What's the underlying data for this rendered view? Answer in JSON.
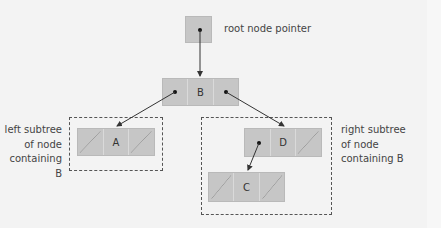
{
  "diagram": {
    "root_pointer": {
      "label": "root node pointer"
    },
    "nodes": {
      "B": {
        "value": "B"
      },
      "A": {
        "value": "A"
      },
      "D": {
        "value": "D"
      },
      "C": {
        "value": "C"
      }
    },
    "edges": [
      {
        "from": "root",
        "to": "B"
      },
      {
        "from": "B.left",
        "to": "A"
      },
      {
        "from": "B.right",
        "to": "D"
      },
      {
        "from": "D.left",
        "to": "C"
      }
    ],
    "left_subtree_label": [
      "left subtree",
      "of node",
      "containing B"
    ],
    "right_subtree_label": [
      "right subtree",
      "of node",
      "containing B"
    ],
    "colors": {
      "node_fill": "#c6c6c6",
      "background": "#f3f3f3",
      "arrow": "#333333",
      "dashed_border": "#555555"
    }
  }
}
